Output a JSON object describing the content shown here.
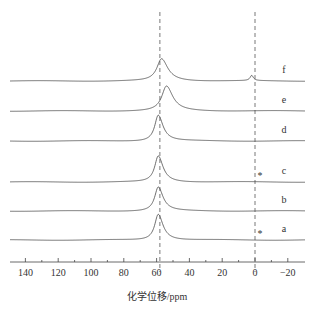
{
  "chart_data": {
    "type": "line",
    "title": "",
    "xlabel": "化学位移/ppm",
    "ylabel": "",
    "xlim": [
      150,
      -28
    ],
    "x_reversed": true,
    "grid": false,
    "x_ticks": [
      140,
      120,
      100,
      80,
      60,
      40,
      20,
      0,
      -20
    ],
    "x_tick_labels": [
      "140",
      "120",
      "100",
      "80",
      "60",
      "40",
      "20",
      "0",
      "−20"
    ],
    "reference_lines_ppm": [
      58,
      0
    ],
    "series": [
      {
        "name": "a",
        "peak_ppm": 59,
        "peak_height": 1.0,
        "peak_width": 2.6,
        "secondary_peak": null,
        "asterisk": true
      },
      {
        "name": "b",
        "peak_ppm": 59,
        "peak_height": 0.92,
        "peak_width": 2.6,
        "secondary_peak": null,
        "asterisk": false
      },
      {
        "name": "c",
        "peak_ppm": 59,
        "peak_height": 1.0,
        "peak_width": 2.6,
        "secondary_peak": null,
        "asterisk": true
      },
      {
        "name": "d",
        "peak_ppm": 59,
        "peak_height": 1.0,
        "peak_width": 2.6,
        "secondary_peak": null,
        "asterisk": false
      },
      {
        "name": "e",
        "peak_ppm": 54,
        "peak_height": 0.95,
        "peak_width": 3.4,
        "secondary_peak": null,
        "asterisk": false
      },
      {
        "name": "f",
        "peak_ppm": 57,
        "peak_height": 0.85,
        "peak_width": 3.4,
        "secondary_peak": {
          "ppm": 2,
          "height": 0.2
        },
        "asterisk": false
      }
    ],
    "annotations": [
      "*",
      "*"
    ]
  }
}
